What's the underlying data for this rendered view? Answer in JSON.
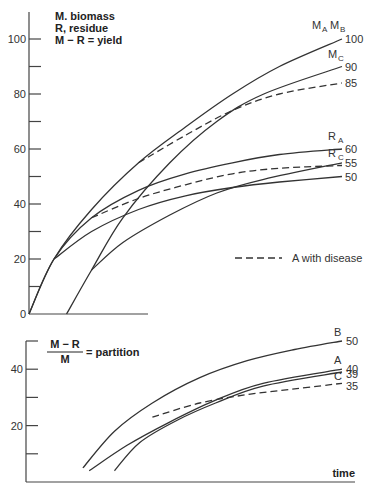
{
  "chart_data": [
    {
      "type": "line",
      "panel": "top",
      "annotation_lines": [
        "M. biomass",
        "R, residue",
        "M − R = yield"
      ],
      "xlabel": "",
      "ylabel": "",
      "ylim": [
        0,
        100
      ],
      "yticks": [
        0,
        10,
        20,
        30,
        40,
        50,
        60,
        70,
        80,
        90,
        100
      ],
      "ytick_labels": [
        "0",
        "",
        "20",
        "",
        "40",
        "",
        "60",
        "",
        "80",
        "",
        "100"
      ],
      "xlim": [
        0,
        100
      ],
      "series": [
        {
          "name": "M_A M_B",
          "label": "M",
          "subs": [
            "A",
            "B"
          ],
          "style": "solid",
          "end_value": 100,
          "end_label": "100",
          "points": [
            [
              0,
              0
            ],
            [
              8,
              20
            ],
            [
              20,
              38
            ],
            [
              35,
              55
            ],
            [
              50,
              68
            ],
            [
              65,
              80
            ],
            [
              80,
              90
            ],
            [
              100,
              100
            ]
          ]
        },
        {
          "name": "M_C",
          "label": "M",
          "subs": [
            "C"
          ],
          "style": "solid",
          "end_value": 90,
          "end_label": "90",
          "points": [
            [
              12,
              0
            ],
            [
              20,
              16
            ],
            [
              30,
              35
            ],
            [
              45,
              55
            ],
            [
              60,
              70
            ],
            [
              75,
              80
            ],
            [
              100,
              90
            ]
          ]
        },
        {
          "name": "M_A with disease",
          "style": "dashed",
          "end_value": 85,
          "end_label": "85",
          "points": [
            [
              35,
              55
            ],
            [
              50,
              65
            ],
            [
              65,
              74
            ],
            [
              80,
              80
            ],
            [
              100,
              84
            ]
          ]
        },
        {
          "name": "R_A",
          "label": "R",
          "subs": [
            "A"
          ],
          "style": "solid",
          "end_value": 60,
          "end_label": "60",
          "points": [
            [
              0,
              0
            ],
            [
              8,
              20
            ],
            [
              20,
              35
            ],
            [
              35,
              45
            ],
            [
              50,
              51
            ],
            [
              65,
              55
            ],
            [
              80,
              58
            ],
            [
              100,
              60
            ]
          ]
        },
        {
          "name": "R_A with disease",
          "style": "dashed",
          "end_value": 55,
          "points": [
            [
              20,
              35
            ],
            [
              35,
              42
            ],
            [
              50,
              47
            ],
            [
              65,
              51
            ],
            [
              80,
              53
            ],
            [
              100,
              54
            ]
          ]
        },
        {
          "name": "R_C",
          "label": "R",
          "subs": [
            "C"
          ],
          "style": "solid",
          "end_value": 55,
          "end_label": "55",
          "points": [
            [
              20,
              16
            ],
            [
              30,
              26
            ],
            [
              45,
              36
            ],
            [
              60,
              44
            ],
            [
              75,
              49
            ],
            [
              100,
              55
            ]
          ]
        },
        {
          "name": "R_B",
          "style": "solid",
          "end_value": 50,
          "end_label": "50",
          "points": [
            [
              8,
              20
            ],
            [
              20,
              30
            ],
            [
              35,
              38
            ],
            [
              50,
              43
            ],
            [
              65,
              46
            ],
            [
              80,
              48
            ],
            [
              100,
              50
            ]
          ]
        }
      ],
      "legend": [
        {
          "style": "dashed",
          "label": "A with disease"
        }
      ],
      "legend_position": "right-middle"
    },
    {
      "type": "line",
      "panel": "bottom",
      "annotation": {
        "numerator": "M − R",
        "denominator": "M",
        "text": "= partition"
      },
      "xlabel": "time",
      "ylim": [
        0,
        50
      ],
      "yticks": [
        0,
        10,
        20,
        30,
        40,
        50
      ],
      "ytick_labels": [
        "",
        "",
        "20",
        "",
        "40",
        ""
      ],
      "xlim": [
        0,
        100
      ],
      "series": [
        {
          "name": "B",
          "style": "solid",
          "end_value": 50,
          "end_label": "50",
          "points": [
            [
              18,
              5
            ],
            [
              28,
              18
            ],
            [
              40,
              28
            ],
            [
              55,
              37
            ],
            [
              70,
              43
            ],
            [
              85,
              47
            ],
            [
              100,
              50
            ]
          ]
        },
        {
          "name": "A",
          "style": "solid",
          "end_value": 40,
          "end_label": "40",
          "points": [
            [
              20,
              4
            ],
            [
              32,
              13
            ],
            [
              45,
              21
            ],
            [
              60,
              29
            ],
            [
              75,
              35
            ],
            [
              100,
              40
            ]
          ]
        },
        {
          "name": "C",
          "style": "solid",
          "end_value": 39,
          "end_label": "39",
          "points": [
            [
              28,
              4
            ],
            [
              36,
              14
            ],
            [
              48,
              22
            ],
            [
              60,
              28
            ],
            [
              75,
              34
            ],
            [
              100,
              39
            ]
          ]
        },
        {
          "name": "A with disease",
          "style": "dashed",
          "end_value": 35,
          "end_label": "35",
          "points": [
            [
              40,
              23
            ],
            [
              55,
              28
            ],
            [
              70,
              31
            ],
            [
              85,
              33
            ],
            [
              100,
              35
            ]
          ]
        }
      ]
    }
  ]
}
